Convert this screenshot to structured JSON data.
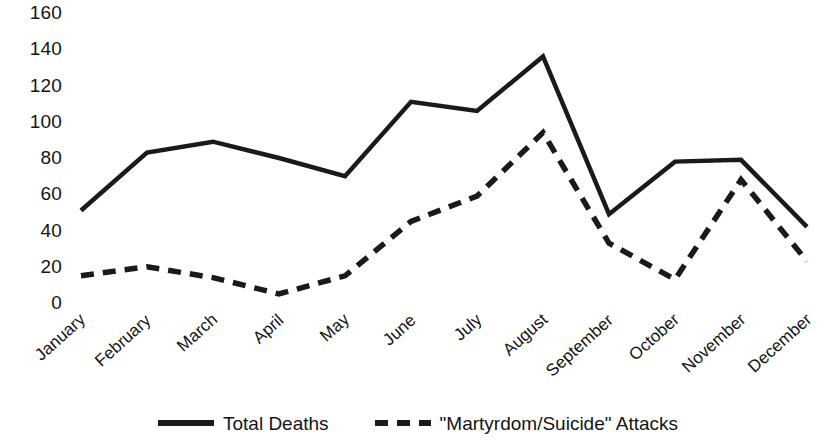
{
  "chart_data": {
    "type": "line",
    "title": "",
    "xlabel": "",
    "ylabel": "",
    "categories": [
      "January",
      "February",
      "March",
      "April",
      "May",
      "June",
      "July",
      "August",
      "September",
      "October",
      "November",
      "December"
    ],
    "ylim": [
      0,
      160
    ],
    "yticks": [
      0,
      20,
      40,
      60,
      80,
      100,
      120,
      140,
      160
    ],
    "grid": false,
    "legend_position": "bottom",
    "series": [
      {
        "name": "Total Deaths",
        "style": "solid",
        "color": "#1a1a1a",
        "values": [
          51,
          83,
          89,
          80,
          70,
          111,
          106,
          136,
          49,
          78,
          79,
          42
        ]
      },
      {
        "name": "\"Martyrdom/Suicide\" Attacks",
        "style": "dashed",
        "color": "#1a1a1a",
        "values": [
          15,
          20,
          14,
          5,
          15,
          45,
          59,
          94,
          33,
          13,
          68,
          23
        ]
      }
    ]
  },
  "axes": {
    "y_tick_labels": [
      "160",
      "140",
      "120",
      "100",
      "80",
      "60",
      "40",
      "20",
      "0"
    ],
    "x_tick_labels": [
      "January",
      "February",
      "March",
      "April",
      "May",
      "June",
      "July",
      "August",
      "September",
      "October",
      "November",
      "December"
    ]
  },
  "legend": {
    "items": [
      {
        "label": "Total Deaths",
        "style": "solid"
      },
      {
        "label": "\"Martyrdom/Suicide\" Attacks",
        "style": "dashed"
      }
    ]
  }
}
